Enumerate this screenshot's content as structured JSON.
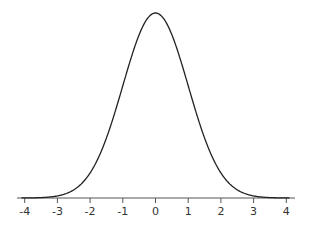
{
  "chart_data": {
    "type": "line",
    "title": "",
    "xlabel": "",
    "ylabel": "",
    "xlim": [
      -4,
      4
    ],
    "ylim": [
      0,
      0.4
    ],
    "grid": false,
    "legend": null,
    "x_ticks": [
      "-4",
      "-3",
      "-2",
      "-1",
      "0",
      "1",
      "2",
      "3",
      "4"
    ],
    "series": [
      {
        "name": "N(0,1) density",
        "x": [
          -4,
          -3.5,
          -3,
          -2.5,
          -2,
          -1.5,
          -1,
          -0.5,
          0,
          0.5,
          1,
          1.5,
          2,
          2.5,
          3,
          3.5,
          4
        ],
        "values": [
          0.0001,
          0.0009,
          0.0044,
          0.0175,
          0.054,
          0.1295,
          0.242,
          0.3521,
          0.3989,
          0.3521,
          0.242,
          0.1295,
          0.054,
          0.0175,
          0.0044,
          0.0009,
          0.0001
        ]
      }
    ],
    "colors": {
      "curve": "#222222",
      "axis": "#555555",
      "background": "#ffffff"
    }
  }
}
